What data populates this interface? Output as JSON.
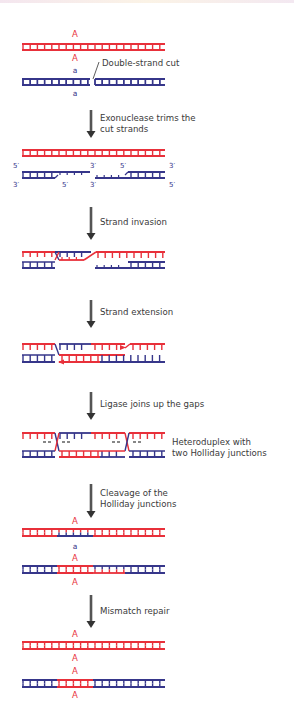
{
  "colors": {
    "maternal_strand": "#e8303a",
    "paternal_strand": "#36368a",
    "arrow": "#555555",
    "text": "#3a3a3a"
  },
  "alleles": {
    "dominant": "A",
    "recessive": "a"
  },
  "strand_ends": {
    "five_prime": "5′",
    "three_prime": "3′"
  },
  "annotations": {
    "cut_label": "Double-strand cut",
    "heteroduplex_line1": "Heteroduplex with",
    "heteroduplex_line2": "two Holliday junctions"
  },
  "steps": [
    {
      "label_line1": "Exonuclease trims the",
      "label_line2": "cut strands"
    },
    {
      "label_line1": "Strand invasion",
      "label_line2": ""
    },
    {
      "label_line1": "Strand extension",
      "label_line2": ""
    },
    {
      "label_line1": "Ligase joins up the gaps",
      "label_line2": ""
    },
    {
      "label_line1": "Cleavage of the",
      "label_line2": "Holliday junctions"
    },
    {
      "label_line1": "Mismatch repair",
      "label_line2": ""
    }
  ]
}
